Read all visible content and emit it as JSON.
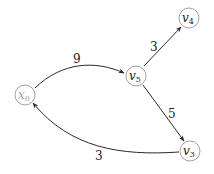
{
  "diagram": {
    "type": "weighted-directed-graph",
    "nodes": [
      {
        "id": "x0",
        "base": "x",
        "sub": "0",
        "faded": true
      },
      {
        "id": "v5",
        "base": "v",
        "sub": "5",
        "faded": false
      },
      {
        "id": "v4",
        "base": "v",
        "sub": "4",
        "faded": false
      },
      {
        "id": "v3",
        "base": "v",
        "sub": "3",
        "faded": false
      }
    ],
    "edges": [
      {
        "from": "x0",
        "to": "v5",
        "weight": "9"
      },
      {
        "from": "v5",
        "to": "v4",
        "weight": "3"
      },
      {
        "from": "v5",
        "to": "v3",
        "weight": "5"
      },
      {
        "from": "v3",
        "to": "x0",
        "weight": "3"
      }
    ]
  }
}
